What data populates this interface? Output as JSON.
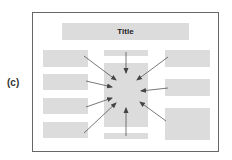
{
  "figure_label": "(c)",
  "title": "Title",
  "colors": {
    "box": "#dcdcdc",
    "frame": "#666666",
    "arrow": "#444444"
  },
  "boxes": {
    "title": {
      "x": 62,
      "y": 23,
      "w": 127,
      "h": 17
    },
    "left": [
      {
        "x": 43,
        "y": 50,
        "w": 45,
        "h": 17
      },
      {
        "x": 43,
        "y": 74,
        "w": 45,
        "h": 16
      },
      {
        "x": 43,
        "y": 98,
        "w": 45,
        "h": 16
      },
      {
        "x": 43,
        "y": 122,
        "w": 45,
        "h": 16
      }
    ],
    "center_top_strip": {
      "x": 104,
      "y": 50,
      "w": 44,
      "h": 6
    },
    "center": {
      "x": 104,
      "y": 63,
      "w": 44,
      "h": 64
    },
    "center_bottom_strip": {
      "x": 104,
      "y": 133,
      "w": 44,
      "h": 6
    },
    "right": [
      {
        "x": 165,
        "y": 50,
        "w": 45,
        "h": 17
      },
      {
        "x": 165,
        "y": 79,
        "w": 45,
        "h": 17
      },
      {
        "x": 165,
        "y": 108,
        "w": 45,
        "h": 32
      }
    ]
  },
  "arrows": [
    {
      "from": [
        126,
        52
      ],
      "to": [
        126,
        73
      ]
    },
    {
      "from": [
        84,
        56
      ],
      "to": [
        116,
        80
      ]
    },
    {
      "from": [
        86,
        81
      ],
      "to": [
        112,
        87
      ]
    },
    {
      "from": [
        86,
        107
      ],
      "to": [
        112,
        98
      ]
    },
    {
      "from": [
        84,
        133
      ],
      "to": [
        116,
        103
      ]
    },
    {
      "from": [
        126,
        136
      ],
      "to": [
        126,
        108
      ]
    },
    {
      "from": [
        168,
        57
      ],
      "to": [
        137,
        80
      ]
    },
    {
      "from": [
        168,
        88
      ],
      "to": [
        141,
        91
      ]
    },
    {
      "from": [
        166,
        121
      ],
      "to": [
        140,
        102
      ]
    }
  ]
}
